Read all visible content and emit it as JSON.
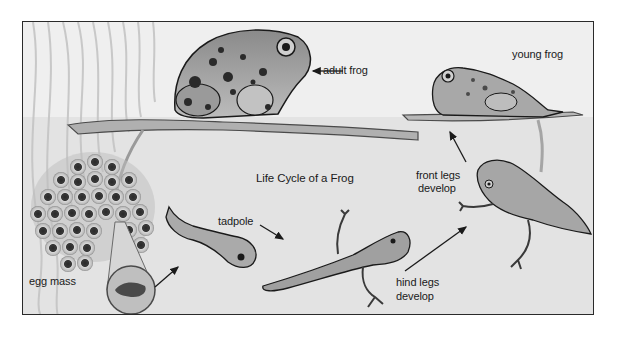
{
  "diagram": {
    "title": "Life Cycle of a Frog",
    "stages": [
      {
        "id": "egg-mass",
        "label": "egg mass"
      },
      {
        "id": "tadpole",
        "label": "tadpole"
      },
      {
        "id": "hind-legs",
        "label_line1": "hind legs",
        "label_line2": "develop"
      },
      {
        "id": "front-legs",
        "label_line1": "front legs",
        "label_line2": "develop"
      },
      {
        "id": "young-frog",
        "label": "young frog"
      },
      {
        "id": "adult-frog",
        "label": "adult frog"
      }
    ],
    "arrows": [
      {
        "from": "egg-mass",
        "to": "tadpole"
      },
      {
        "from": "tadpole-label",
        "to": "tadpole-with-tail"
      },
      {
        "from": "hind-legs",
        "to": "front-legs"
      },
      {
        "from": "front-legs",
        "to": "young-frog"
      },
      {
        "from": "adult-frog-label",
        "to": "adult-frog"
      }
    ],
    "colors": {
      "frame_border": "#2a2a2a",
      "background": "#efefef",
      "water": "#dcdcdc",
      "ink": "#1a1a1a"
    }
  }
}
